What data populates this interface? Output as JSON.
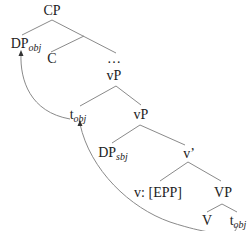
{
  "diagram": {
    "type": "syntax-tree",
    "nodes": {
      "cp": {
        "label": "CP"
      },
      "dp_obj": {
        "label": "DP",
        "sub": "obj"
      },
      "c": {
        "label": "C"
      },
      "ellipsis": {
        "label": "…"
      },
      "vp_top": {
        "label": "vP"
      },
      "t_obj_mid": {
        "label": "t",
        "sub": "obj"
      },
      "vp_mid": {
        "label": "vP"
      },
      "dp_sbj": {
        "label": "DP",
        "sub": "sbj"
      },
      "v_bar": {
        "label": "v’"
      },
      "v_epp": {
        "label": "v: [EPP]"
      },
      "vp_low": {
        "label": "VP"
      },
      "v_head": {
        "label": "V"
      },
      "t_obj_low": {
        "label": "t",
        "sub": "obj"
      }
    },
    "edges": [
      [
        "cp",
        "dp_obj"
      ],
      [
        "cp",
        "ellipsis"
      ],
      [
        "cp",
        "c"
      ],
      [
        "vp_top",
        "t_obj_mid"
      ],
      [
        "vp_top",
        "vp_mid"
      ],
      [
        "vp_mid",
        "dp_sbj"
      ],
      [
        "vp_mid",
        "v_bar"
      ],
      [
        "v_bar",
        "v_epp"
      ],
      [
        "v_bar",
        "vp_low"
      ],
      [
        "vp_low",
        "v_head"
      ],
      [
        "vp_low",
        "t_obj_low"
      ]
    ],
    "movement_arrows": [
      {
        "from": "t_obj_low",
        "to": "t_obj_mid"
      },
      {
        "from": "t_obj_mid",
        "to": "dp_obj"
      }
    ],
    "colors": {
      "line": "#888888",
      "text": "#222222"
    }
  }
}
